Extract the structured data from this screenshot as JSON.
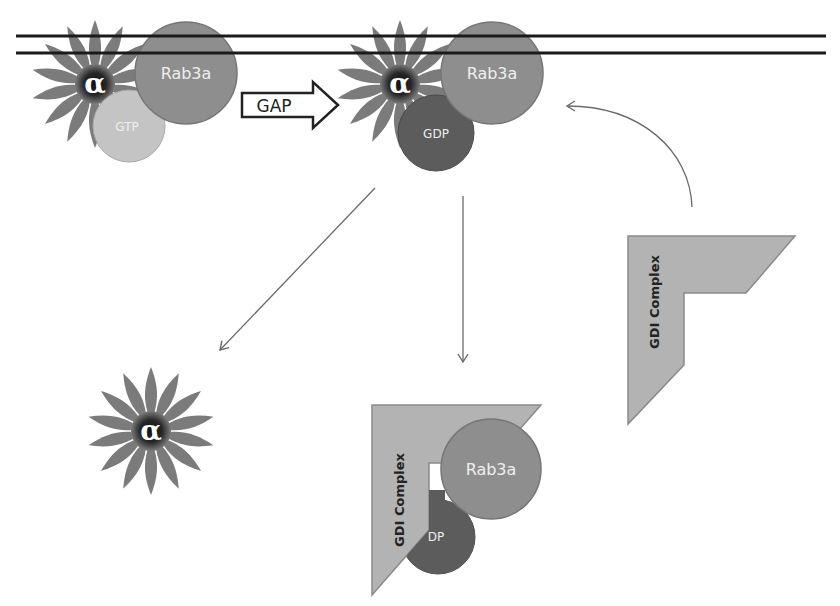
{
  "diagram": {
    "title": "",
    "colors": {
      "background": "#ffffff",
      "membrane": "#1a1a1a",
      "petal": "#7b7b7b",
      "flower_center": "#1e1e1e",
      "rab3a": "#8e8e8e",
      "rab3a_stroke": "#767676",
      "gtp": "#c4c4c4",
      "gdp": "#5c5c5c",
      "gdi": "#b3b3b3",
      "gdi_stroke": "#8a8a8a",
      "arrow": "#6a6a6a"
    },
    "membrane": {
      "lines": [
        {
          "y": 36
        },
        {
          "y": 53
        }
      ],
      "x_start": 16,
      "x_end": 826
    },
    "states": [
      {
        "name": "membrane-bound-gtp",
        "alpha_label": "α",
        "rab_label": "Rab3a",
        "nucleotide_label": "GTP"
      },
      {
        "name": "membrane-bound-gdp",
        "alpha_label": "α",
        "rab_label": "Rab3a",
        "nucleotide_label": "GDP"
      },
      {
        "name": "free-alpha",
        "alpha_label": "α"
      },
      {
        "name": "gdi-bound-rab3a",
        "gdi_label": "GDI Complex",
        "rab_label": "Rab3a",
        "nucleotide_label": "DP"
      },
      {
        "name": "free-gdi",
        "gdi_label": "GDI Complex"
      }
    ],
    "gap_arrow": {
      "label": "GAP"
    },
    "arrows": [
      {
        "name": "gdp-state-to-free-alpha",
        "from": [
          375,
          188
        ],
        "to": [
          220,
          350
        ],
        "type": "straight"
      },
      {
        "name": "gdp-state-to-gdi-complex",
        "from": [
          463,
          196
        ],
        "to": [
          463,
          362
        ],
        "type": "straight"
      },
      {
        "name": "gdi-complex-to-gdp-state",
        "from": [
          692,
          207
        ],
        "to": [
          567,
          106
        ],
        "type": "curved"
      }
    ]
  }
}
